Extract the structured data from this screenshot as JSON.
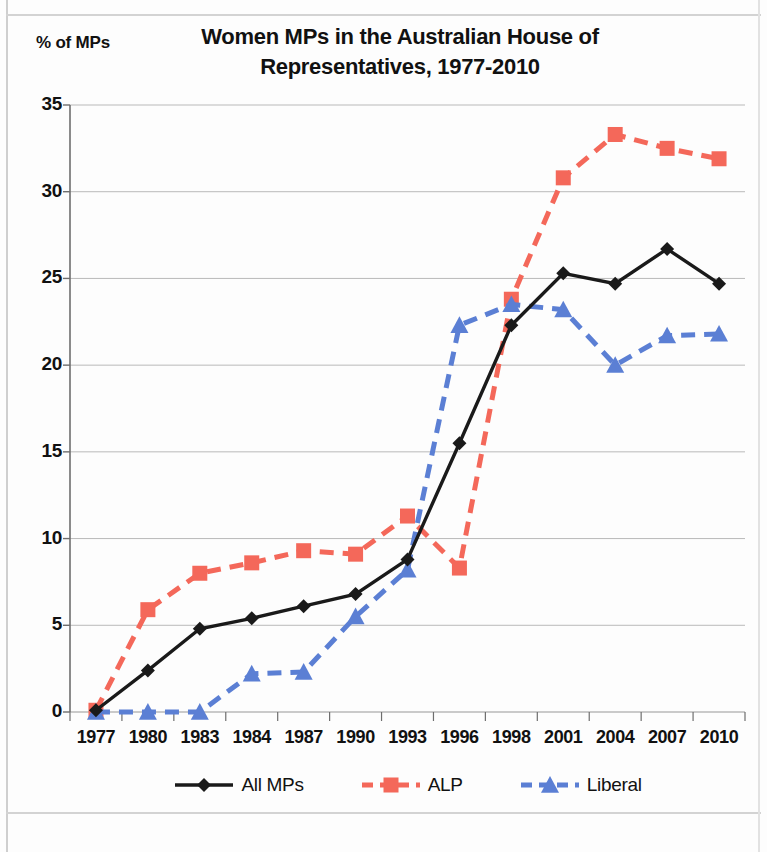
{
  "chart_data": {
    "type": "line",
    "title": "Women MPs in the Australian House of Representatives, 1977-2010",
    "title_line1": "Women MPs in the Australian House of",
    "title_line2": "Representatives, 1977-2010",
    "xlabel": "",
    "ylabel": "% of MPs",
    "categories": [
      "1977",
      "1980",
      "1983",
      "1984",
      "1987",
      "1990",
      "1993",
      "1996",
      "1998",
      "2001",
      "2004",
      "2007",
      "2010"
    ],
    "ylim": [
      0,
      35
    ],
    "yticks": [
      0,
      5,
      10,
      15,
      20,
      25,
      30,
      35
    ],
    "ytick_labels": [
      "0",
      "5",
      "10",
      "15",
      "20",
      "25",
      "30",
      "35"
    ],
    "grid": true,
    "grid_axis": "y",
    "legend_position": "bottom",
    "series": [
      {
        "name": "All MPs",
        "color": "#1a1a1a",
        "marker": "diamond",
        "dash": "solid",
        "values": [
          0.1,
          2.4,
          4.8,
          5.4,
          6.1,
          6.8,
          8.8,
          15.5,
          22.3,
          25.3,
          24.7,
          26.7,
          24.7
        ]
      },
      {
        "name": "ALP",
        "color": "#f4685a",
        "marker": "square",
        "dash": "dashed",
        "values": [
          0.1,
          5.9,
          8.0,
          8.6,
          9.3,
          9.1,
          11.3,
          8.3,
          23.8,
          30.8,
          33.3,
          32.5,
          31.9
        ]
      },
      {
        "name": "Liberal",
        "color": "#5b7fd4",
        "marker": "triangle",
        "dash": "dashed",
        "values": [
          0.0,
          0.0,
          0.0,
          2.2,
          2.3,
          5.5,
          8.2,
          22.3,
          23.5,
          23.2,
          20.0,
          21.7,
          21.8
        ]
      }
    ]
  },
  "legend": {
    "items": [
      {
        "label": "All MPs"
      },
      {
        "label": "ALP"
      },
      {
        "label": "Liberal"
      }
    ]
  }
}
